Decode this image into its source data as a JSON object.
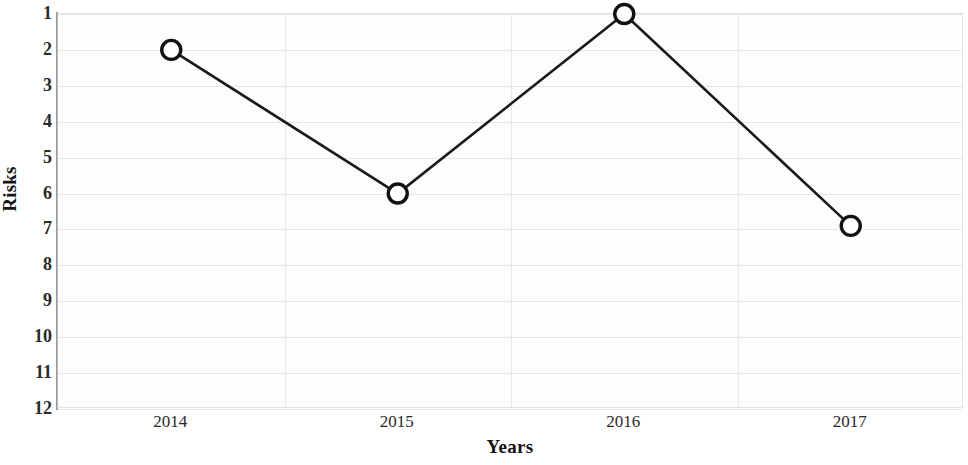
{
  "chart_data": {
    "type": "line",
    "title": "",
    "xlabel": "Years",
    "ylabel": "Risks",
    "categories": [
      "2014",
      "2015",
      "2016",
      "2017"
    ],
    "x": [
      2014,
      2015,
      2016,
      2017
    ],
    "values": [
      2,
      6,
      1,
      6.9
    ],
    "series": [
      {
        "name": "Risks",
        "values": [
          2,
          6,
          1,
          6.9
        ]
      }
    ],
    "ylim": [
      1,
      12
    ],
    "y_inverted": true,
    "y_ticks": [
      1,
      2,
      3,
      4,
      5,
      6,
      7,
      8,
      9,
      10,
      11,
      12
    ],
    "y_tick_labels": [
      "1",
      "2",
      "3",
      "4",
      "5",
      "6",
      "7",
      "8",
      "9",
      "10",
      "11",
      "12"
    ],
    "x_tick_labels": [
      "2014",
      "2015",
      "2016",
      "2017"
    ],
    "grid": true,
    "grid_axis": "both",
    "legend": false,
    "legend_position": "none",
    "marker": "open-circle",
    "line_color": "#1a1a1a",
    "marker_face_color": "#ffffff",
    "marker_edge_color": "#111111",
    "grid_color": "#e6e6e6",
    "background_color": "#fdfdfd",
    "annotations": []
  },
  "axis": {
    "y_label": "Risks",
    "x_label": "Years"
  }
}
